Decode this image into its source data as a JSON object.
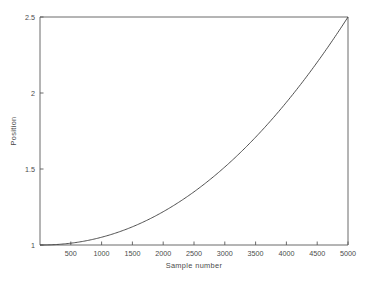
{
  "chart_data": {
    "type": "line",
    "title": "",
    "xlabel": "Sample number",
    "ylabel": "Position",
    "xlim": [
      0,
      5000
    ],
    "ylim": [
      1,
      2.5
    ],
    "grid": false,
    "legend": null,
    "xticks": [
      500,
      1000,
      1500,
      2000,
      2500,
      3000,
      3500,
      4000,
      4500,
      5000
    ],
    "xticklabels": [
      "500",
      "1000",
      "1500",
      "2000",
      "2500",
      "3000",
      "3500",
      "4000",
      "4500",
      "5000"
    ],
    "yticks": [
      1,
      1.5,
      2,
      2.5
    ],
    "yticklabels": [
      "1",
      "1.5",
      "2",
      "2.5"
    ],
    "line_color": "#3c3c3c",
    "axis_color": "#5a5a5a",
    "background": "#ffffff",
    "series": [
      {
        "name": "position",
        "x": [
          0,
          250,
          500,
          750,
          1000,
          1250,
          1500,
          1750,
          2000,
          2250,
          2500,
          2750,
          3000,
          3250,
          3500,
          3750,
          4000,
          4250,
          4500,
          4750,
          5000
        ],
        "y": [
          1.0,
          1.003,
          1.012,
          1.027,
          1.049,
          1.076,
          1.11,
          1.149,
          1.194,
          1.245,
          1.302,
          1.364,
          1.432,
          1.505,
          1.584,
          1.668,
          1.758,
          1.853,
          1.954,
          2.06,
          2.5
        ]
      }
    ],
    "curve_note": "monotonic increasing convex curve from 1.0 at sample 0 to 2.5 at sample 5000"
  },
  "axis_labels": {
    "x_title": "Sample number",
    "y_title": "Position"
  }
}
